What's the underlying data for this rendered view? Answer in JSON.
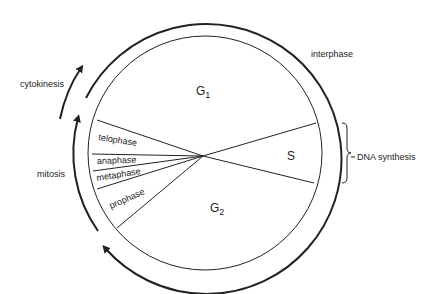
{
  "diagram": {
    "type": "cell-cycle",
    "phases": {
      "g1": {
        "label": "G",
        "subscript": "1"
      },
      "s": {
        "label": "S"
      },
      "g2": {
        "label": "G",
        "subscript": "2"
      }
    },
    "mitosis_stages": [
      {
        "label": "telophase"
      },
      {
        "label": "anaphase"
      },
      {
        "label": "metaphase"
      },
      {
        "label": "prophase"
      }
    ],
    "outer_labels": {
      "interphase": "interphase",
      "cytokinesis": "cytokinesis",
      "mitosis": "mitosis",
      "dna_synthesis": "DNA synthesis"
    },
    "colors": {
      "line": "#222222",
      "background": "#ffffff"
    }
  }
}
